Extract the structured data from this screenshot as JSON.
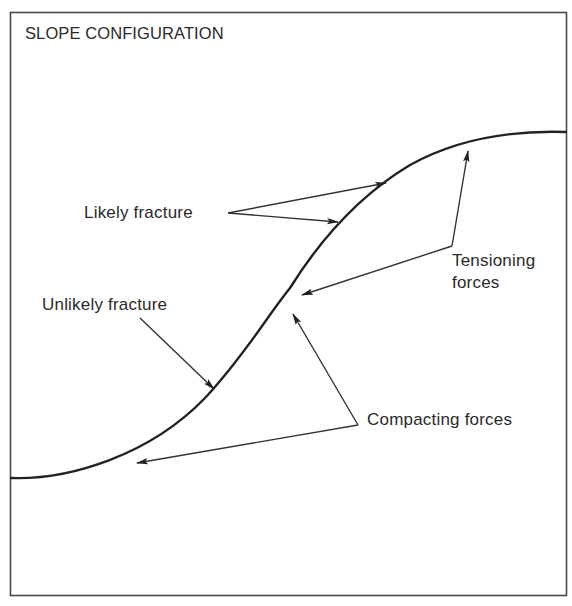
{
  "title": "SLOPE CONFIGURATION",
  "labels": {
    "likely_fracture": "Likely fracture",
    "unlikely_fracture": "Unlikely fracture",
    "tensioning_line1": "Tensioning",
    "tensioning_line2": "forces",
    "compacting_forces": "Compacting forces"
  },
  "colors": {
    "line": "#222222",
    "frame": "#4a4a4a",
    "background": "#ffffff"
  }
}
